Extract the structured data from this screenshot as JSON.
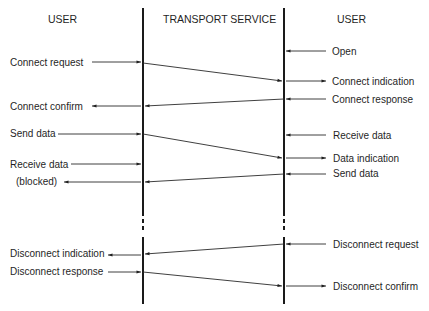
{
  "headers": {
    "left": "USER",
    "center": "TRANSPORT SERVICE",
    "right": "USER"
  },
  "left_labels": [
    {
      "text": "Connect request",
      "y": 63
    },
    {
      "text": "Connect confirm",
      "y": 106
    },
    {
      "text": "Send data",
      "y": 134
    },
    {
      "text": "Receive data",
      "y": 165
    },
    {
      "text": "(blocked)",
      "y": 182
    },
    {
      "text": "Disconnect indication",
      "y": 254
    },
    {
      "text": "Disconnect response",
      "y": 272
    }
  ],
  "right_labels": [
    {
      "text": "Open",
      "y": 51
    },
    {
      "text": "Connect indication",
      "y": 81
    },
    {
      "text": "Connect response",
      "y": 99
    },
    {
      "text": "Receive data",
      "y": 135
    },
    {
      "text": "Data indication",
      "y": 158
    },
    {
      "text": "Send data",
      "y": 174
    },
    {
      "text": "Disconnect request",
      "y": 244
    },
    {
      "text": "Disconnect confirm",
      "y": 286
    }
  ],
  "messages": [
    {
      "from": "left",
      "y_from": 63,
      "y_to": 81
    },
    {
      "from": "right",
      "y_from": 99,
      "y_to": 106
    },
    {
      "from": "left",
      "y_from": 134,
      "y_to": 158
    },
    {
      "from": "right",
      "y_from": 174,
      "y_to": 182
    },
    {
      "from": "right",
      "y_from": 244,
      "y_to": 254
    },
    {
      "from": "left",
      "y_from": 272,
      "y_to": 286
    }
  ],
  "lifelines": {
    "left_x": 143,
    "right_x": 284,
    "top_y": 8,
    "bottom_y": 304,
    "gap_start_y": 212,
    "gap_end_y": 237
  }
}
